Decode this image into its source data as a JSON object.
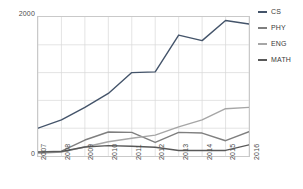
{
  "chart_data": {
    "type": "line",
    "title": "",
    "xlabel": "",
    "ylabel": "",
    "categories": [
      "2007",
      "2008",
      "2009",
      "2010",
      "2011",
      "2012",
      "2013",
      "2014",
      "2015",
      "2016"
    ],
    "ylim": [
      0,
      2000
    ],
    "xlim_labels": [
      "2007",
      "2016"
    ],
    "yticks": [
      0,
      2000
    ],
    "ytick_labels": [
      "0",
      "2000"
    ],
    "grid": true,
    "legend_position": "right",
    "series": [
      {
        "name": "CS",
        "color": "#44546a",
        "values": [
          400,
          520,
          700,
          900,
          1200,
          1210,
          1740,
          1660,
          1950,
          1900
        ]
      },
      {
        "name": "PHY",
        "color": "#7f7f7f",
        "values": [
          60,
          70,
          230,
          345,
          340,
          195,
          340,
          330,
          220,
          350
        ]
      },
      {
        "name": "ENG",
        "color": "#a6a6a6",
        "values": [
          40,
          55,
          130,
          205,
          255,
          300,
          420,
          520,
          680,
          700
        ]
      },
      {
        "name": "MATH",
        "color": "#595959",
        "values": [
          55,
          65,
          130,
          150,
          140,
          125,
          80,
          80,
          80,
          160
        ]
      }
    ]
  },
  "legend": {
    "items": [
      {
        "label": "CS"
      },
      {
        "label": "PHY"
      },
      {
        "label": "ENG"
      },
      {
        "label": "MATH"
      }
    ]
  },
  "axis": {
    "y_top_label": "2000",
    "y_bottom_label": "0"
  },
  "colors": {
    "grid": "#d9d9d9",
    "frame": "#c9c9c9",
    "text": "#4a4a4a",
    "background": "#ffffff"
  }
}
